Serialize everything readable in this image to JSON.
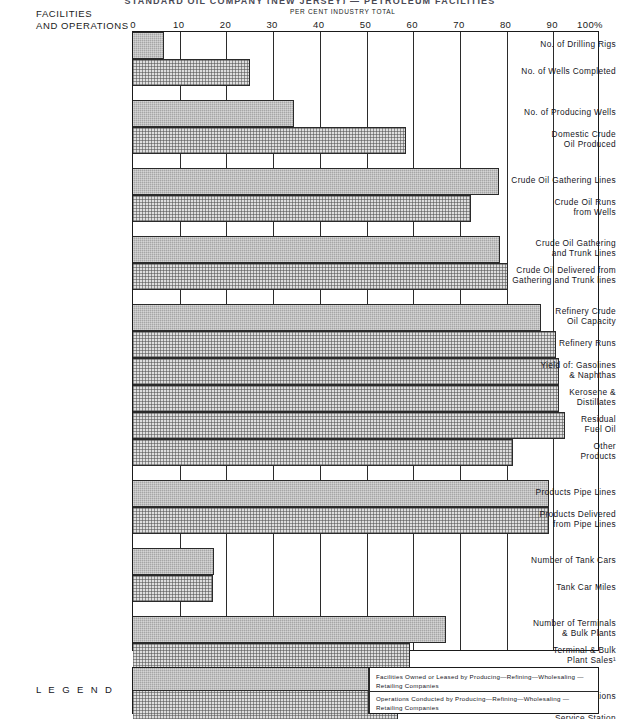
{
  "title_sliver": "STANDARD OIL COMPANY (NEW JERSEY) — PETROLEUM FACILITIES",
  "header": {
    "facilities_label": "FACILITIES\nAND OPERATIONS",
    "percent_label": "PER CENT INDUSTRY TOTAL"
  },
  "chart_data": {
    "type": "bar",
    "orientation": "horizontal",
    "title": "",
    "xlabel": "PER CENT INDUSTRY TOTAL",
    "ylabel": "FACILITIES AND OPERATIONS",
    "xlim": [
      0,
      100
    ],
    "xticks": [
      0,
      10,
      20,
      30,
      40,
      50,
      60,
      70,
      80,
      90,
      100
    ],
    "xtick_labels": [
      "0",
      "10",
      "20",
      "30",
      "40",
      "50",
      "60",
      "70",
      "80",
      "90",
      "100%"
    ],
    "grid": true,
    "legend_position": "bottom",
    "series": [
      {
        "name": "Facilities Owned or Leased by Producing—Refining—Wholesaling—Retailing Companies",
        "key": "facilities",
        "color": "#a6a6a6"
      },
      {
        "name": "Operations Conducted by Producing—Refining—Wholesaling—Retailing Companies",
        "key": "operations",
        "color": "#dedede"
      }
    ],
    "groups": [
      {
        "gap_before": 0,
        "rows": [
          {
            "label": "No. of Drilling Rigs",
            "series": "facilities",
            "value": 6.6
          },
          {
            "label": "No. of Wells Completed",
            "series": "operations",
            "value": 25.0
          }
        ]
      },
      {
        "gap_before": 14,
        "rows": [
          {
            "label": "No. of Producing Wells",
            "series": "facilities",
            "value": 34.5
          },
          {
            "label": "Domestic Crude\nOil Produced",
            "series": "operations",
            "value": 58.5
          }
        ]
      },
      {
        "gap_before": 14,
        "rows": [
          {
            "label": "Crude Oil Gathering Lines",
            "series": "facilities",
            "value": 78.4
          },
          {
            "label": "Crude Oil Runs\nfrom Wells",
            "series": "operations",
            "value": 72.4
          }
        ]
      },
      {
        "gap_before": 14,
        "rows": [
          {
            "label": "Crude Oil Gathering\nand Trunk Lines",
            "series": "facilities",
            "value": 78.6
          },
          {
            "label": "Crude Oil Delivered from\nGathering and Trunk lines",
            "series": "operations",
            "value": 80.3
          }
        ]
      },
      {
        "gap_before": 14,
        "rows": [
          {
            "label": "Refinery Crude\nOil Capacity",
            "series": "facilities",
            "value": 87.4
          },
          {
            "label": "Refinery Runs",
            "series": "operations",
            "value": 90.6
          },
          {
            "label": "Yield of:  Gasolines\n& Naphthas",
            "series": "operations",
            "value": 91.3
          },
          {
            "label": "Kerosene &\nDistillates",
            "series": "operations",
            "value": 91.3
          },
          {
            "label": "Residual\nFuel Oil",
            "series": "operations",
            "value": 92.4
          },
          {
            "label": "Other\nProducts",
            "series": "operations",
            "value": 81.4
          }
        ]
      },
      {
        "gap_before": 14,
        "rows": [
          {
            "label": "Products Pipe Lines",
            "series": "facilities",
            "value": 89.0
          },
          {
            "label": "Products Delivered\nfrom Pipe Lines",
            "series": "operations",
            "value": 89.1
          }
        ]
      },
      {
        "gap_before": 14,
        "rows": [
          {
            "label": "Number of Tank Cars",
            "series": "facilities",
            "value": 17.3
          },
          {
            "label": "Tank Car Miles",
            "series": "operations",
            "value": 17.1
          }
        ]
      },
      {
        "gap_before": 14,
        "rows": [
          {
            "label": "Number of Terminals\n& Bulk Plants",
            "series": "facilities",
            "value": 67.0
          },
          {
            "label": "Terminal & Bulk\nPlant Sales¹",
            "series": "operations",
            "value": 59.3
          }
        ]
      },
      {
        "gap_before": 14,
        "rows": [
          {
            "label": "No. of Service Stations",
            "series": "facilities",
            "value": 50.8
          },
          {
            "label": "Service Station\nSales of Gasoline",
            "series": "operations",
            "value": 56.7
          }
        ]
      }
    ]
  },
  "legend": {
    "word": "L E G E N D",
    "entries": [
      {
        "series": "facilities",
        "text": "Facilities Owned or Leased by Producing—Refining—Wholesaling —\n    Retailing  Companies"
      },
      {
        "series": "operations",
        "text": "Operations Conducted by  Producing—Refining—Wholesaling —\n    Retailing  Companies"
      }
    ]
  }
}
